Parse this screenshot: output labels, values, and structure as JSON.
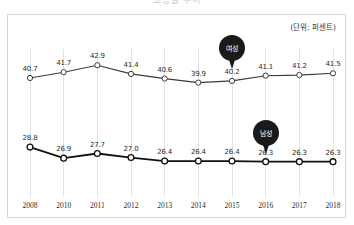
{
  "figure": {
    "title_faint": "고용률 추이",
    "unit_label": "(단위: 퍼센트)"
  },
  "annotations": {
    "female_pin": "여성",
    "male_pin": "남성"
  },
  "chart_data": {
    "type": "line",
    "title": "고용률 추이",
    "subtitle": "(단위: 퍼센트)",
    "xlabel": "",
    "ylabel": "",
    "unit": "퍼센트",
    "grid": true,
    "legend_position": "inline-pin-annotations",
    "ylim": [
      24,
      45
    ],
    "categories": [
      "2008",
      "2010",
      "2011",
      "2012",
      "2013",
      "2014",
      "2015",
      "2016",
      "2017",
      "2018"
    ],
    "series": [
      {
        "name": "여성",
        "name_en": "Female",
        "color": "#3a3a3a",
        "values": [
          40.7,
          41.7,
          42.9,
          41.4,
          40.6,
          39.9,
          40.2,
          41.1,
          41.2,
          41.5
        ]
      },
      {
        "name": "남성",
        "name_en": "Male",
        "color": "#111111",
        "values": [
          28.8,
          26.9,
          27.7,
          27.0,
          26.4,
          26.4,
          26.4,
          26.3,
          26.3,
          26.3
        ]
      }
    ],
    "annotations": [
      {
        "text": "여성",
        "attached_to_series": "여성",
        "near_category": "2015"
      },
      {
        "text": "남성",
        "attached_to_series": "남성",
        "near_category": "2016"
      }
    ]
  },
  "colors": {
    "female_line": "#3a3a3a",
    "male_line": "#111111",
    "marker_fill": "#ffffff",
    "gridline": "#e2e2e2",
    "frame_border": "#d8d8d8",
    "pin_fill": "#1a1a1a",
    "text": "#2b2b2b"
  }
}
